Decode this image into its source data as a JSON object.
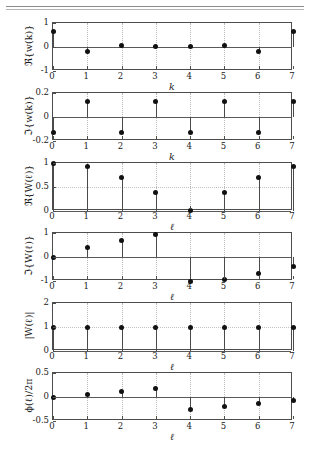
{
  "figure": {
    "background": "#ffffff",
    "axis_color": "#4d4d4d",
    "marker_color": "#111111",
    "stem_color": "#4a4a4a",
    "grid_color": "#b9b9b9"
  },
  "chart_data": [
    {
      "type": "line",
      "plot_style": "stem",
      "title": "",
      "xlabel": "k",
      "ylabel": "ℜ{w(k)}",
      "x": [
        0,
        1,
        2,
        3,
        4,
        5,
        6,
        7
      ],
      "values": [
        0.65,
        -0.18,
        0.08,
        0.01,
        0.01,
        0.08,
        -0.18,
        0.65
      ],
      "xlim": [
        0,
        7
      ],
      "ylim": [
        -1,
        1
      ],
      "yticks": [
        -1,
        0,
        1
      ],
      "ytick_labels": [
        "-1",
        "0",
        "1"
      ],
      "xticks": [
        0,
        1,
        2,
        3,
        4,
        5,
        6,
        7
      ],
      "xtick_labels": [
        "0",
        "1",
        "2",
        "3",
        "4",
        "5",
        "6",
        "7"
      ],
      "grid": true,
      "legend": "none"
    },
    {
      "type": "line",
      "plot_style": "stem",
      "title": "",
      "xlabel": "k",
      "ylabel": "ℑ{w(k)}",
      "x": [
        0,
        1,
        2,
        3,
        4,
        5,
        6,
        7
      ],
      "values": [
        -0.13,
        0.13,
        -0.13,
        0.13,
        -0.13,
        0.13,
        -0.13,
        0.13
      ],
      "xlim": [
        0,
        7
      ],
      "ylim": [
        -0.2,
        0.2
      ],
      "yticks": [
        -0.2,
        0,
        0.2
      ],
      "ytick_labels": [
        "-0.2",
        "0",
        "0.2"
      ],
      "xticks": [
        0,
        1,
        2,
        3,
        4,
        5,
        6,
        7
      ],
      "xtick_labels": [
        "0",
        "1",
        "2",
        "3",
        "4",
        "5",
        "6",
        "7"
      ],
      "grid": true,
      "legend": "none"
    },
    {
      "type": "line",
      "plot_style": "stem",
      "title": "",
      "xlabel": "ℓ",
      "ylabel": "ℜ{W(ℓ)}",
      "x": [
        0,
        1,
        2,
        3,
        4,
        5,
        6,
        7
      ],
      "values": [
        1.0,
        0.92,
        0.7,
        0.39,
        0.02,
        0.39,
        0.7,
        0.92
      ],
      "xlim": [
        0,
        7
      ],
      "ylim": [
        0,
        1
      ],
      "yticks": [
        0,
        0.5,
        1
      ],
      "ytick_labels": [
        "0",
        "0.5",
        "1"
      ],
      "xticks": [
        0,
        1,
        2,
        3,
        4,
        5,
        6,
        7
      ],
      "xtick_labels": [
        "0",
        "1",
        "2",
        "3",
        "4",
        "5",
        "6",
        "7"
      ],
      "grid": true,
      "legend": "none"
    },
    {
      "type": "line",
      "plot_style": "stem",
      "title": "",
      "xlabel": "ℓ",
      "ylabel": "ℑ{W(ℓ)}",
      "x": [
        0,
        1,
        2,
        3,
        4,
        5,
        6,
        7
      ],
      "values": [
        0.0,
        0.39,
        0.7,
        0.92,
        -1.0,
        -0.92,
        -0.7,
        -0.39
      ],
      "xlim": [
        0,
        7
      ],
      "ylim": [
        -1,
        1
      ],
      "yticks": [
        -1,
        0,
        1
      ],
      "ytick_labels": [
        "-1",
        "0",
        "1"
      ],
      "xticks": [
        0,
        1,
        2,
        3,
        4,
        5,
        6,
        7
      ],
      "xtick_labels": [
        "0",
        "1",
        "2",
        "3",
        "4",
        "5",
        "6",
        "7"
      ],
      "grid": true,
      "legend": "none"
    },
    {
      "type": "line",
      "plot_style": "stem",
      "title": "",
      "xlabel": "ℓ",
      "ylabel": "|W(ℓ)|",
      "x": [
        0,
        1,
        2,
        3,
        4,
        5,
        6,
        7
      ],
      "values": [
        1.0,
        1.0,
        1.0,
        1.0,
        1.0,
        1.0,
        1.0,
        1.0
      ],
      "xlim": [
        0,
        7
      ],
      "ylim": [
        0,
        2
      ],
      "yticks": [
        0,
        1,
        2
      ],
      "ytick_labels": [
        "0",
        "1",
        "2"
      ],
      "xticks": [
        0,
        1,
        2,
        3,
        4,
        5,
        6,
        7
      ],
      "xtick_labels": [
        "0",
        "1",
        "2",
        "3",
        "4",
        "5",
        "6",
        "7"
      ],
      "grid": true,
      "legend": "none"
    },
    {
      "type": "line",
      "plot_style": "stem",
      "title": "",
      "xlabel": "ℓ",
      "ylabel": "ϕ(ℓ)/2π",
      "x": [
        0,
        1,
        2,
        3,
        4,
        5,
        6,
        7
      ],
      "values": [
        0.0,
        0.0625,
        0.125,
        0.1875,
        -0.25,
        -0.1875,
        -0.125,
        -0.0625
      ],
      "xlim": [
        0,
        7
      ],
      "ylim": [
        -0.5,
        0.5
      ],
      "yticks": [
        -0.5,
        0,
        0.5
      ],
      "ytick_labels": [
        "-0.5",
        "0",
        "0.5"
      ],
      "xticks": [
        0,
        1,
        2,
        3,
        4,
        5,
        6,
        7
      ],
      "xtick_labels": [
        "0",
        "1",
        "2",
        "3",
        "4",
        "5",
        "6",
        "7"
      ],
      "grid": true,
      "legend": "none"
    }
  ]
}
